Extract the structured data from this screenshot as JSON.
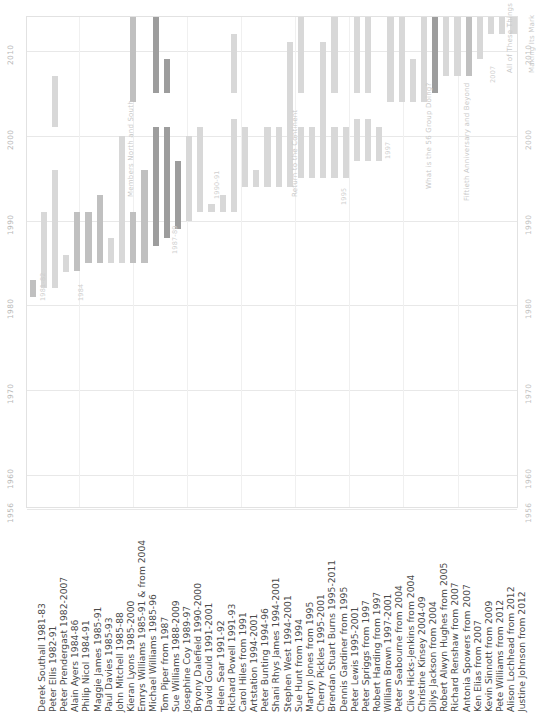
{
  "chart_data": {
    "type": "bar",
    "title": "",
    "subtitle": "",
    "xlabel": "",
    "ylabel": "",
    "ylim": [
      1956,
      2014
    ],
    "orientation": "vertical-timeline",
    "grid": true,
    "legend_position": "none",
    "y_ticks": [
      "2010",
      "2000",
      "1990",
      "1980",
      "1970",
      "1960",
      "1956"
    ],
    "y_tick_values": [
      2010,
      2000,
      1990,
      1980,
      1970,
      1960,
      1956
    ],
    "y_ticks_right": [
      "2010",
      "2000",
      "1990",
      "1980",
      "1970",
      "1960",
      "1956"
    ],
    "categories": [
      "Derek Southall  1981-83",
      "Peter Ellis  1982-91",
      "Peter Prendergast  1982-2007",
      "Alain Ayers  1984-86",
      "Philip Nicol  1984-91",
      "Maggie James  1985-91",
      "Paul Davies  1985-93",
      "John Mitchell  1985-88",
      "Kieran Lyons  1985-2000",
      "Emrys Williams  1985-91 & from 2004",
      "Michael Williams  1985-96",
      "Tom Piper  from 1987",
      "Sue Williams  1988-2009",
      "Josephine Coy  1989-97",
      "Bryony Dalefield  1990-2000",
      "David Gould  1991-2001",
      "Helen Sear  1991-92",
      "Richard Powell  1991-93",
      "Carol Hiles  from 1991",
      "Artstation  1994-2001",
      "Peter Bunting  1994-96",
      "Shani Rhys James  1994-2001",
      "Stephen West  1994-2001",
      "Sue Hunt  from 1994",
      "Martyn Jones  from 1995",
      "Cherry Pickles  1995-2001",
      "Brendan Stuart Burns  1995-2011",
      "Dennis Gardiner  from 1995",
      "Peter Lewis  1995-2001",
      "Peter Spriggs  from 1997",
      "Robert Harding  from 1997",
      "William Brown  1997-2001",
      "Peter Seabourne  from 2004",
      "Clive Hicks-Jenkins  from 2004",
      "Christine Kinsey  2004-09",
      "Dilys Jackson  from 2004",
      "Robert Alwyn Hughes  from 2005",
      "Richard Renshaw  from 2007",
      "Antonia Spowers  from 2007",
      "Ken Elias  from 2007",
      "Kevin Sinnott  from 2009",
      "Pete Williams  from 2012",
      "Alison Lochhead  from 2012",
      "Justine Johnson  from 2012"
    ],
    "bars": [
      {
        "label": "Derek Southall  1981-83",
        "start": 1981,
        "end": 1983,
        "tone": "mid"
      },
      {
        "label": "Peter Ellis  1982-91",
        "start": 1982,
        "end": 1991,
        "tone": "light"
      },
      {
        "label": "Peter Prendergast  1982-2007",
        "start": 1982,
        "end": 2007,
        "tone": "light",
        "gap_start": 1996,
        "gap_end": 2001
      },
      {
        "label": "Alain Ayers  1984-86",
        "start": 1984,
        "end": 1986,
        "tone": "light"
      },
      {
        "label": "Philip Nicol  1984-91",
        "start": 1984,
        "end": 1991,
        "tone": "mid"
      },
      {
        "label": "Maggie James  1985-91",
        "start": 1985,
        "end": 1991,
        "tone": "mid"
      },
      {
        "label": "Paul Davies  1985-93",
        "start": 1985,
        "end": 1993,
        "tone": "mid"
      },
      {
        "label": "John Mitchell  1985-88",
        "start": 1985,
        "end": 1988,
        "tone": "light"
      },
      {
        "label": "Kieran Lyons  1985-2000",
        "start": 1985,
        "end": 2000,
        "tone": "light"
      },
      {
        "label": "Emrys Williams  1985-91 & from 2004",
        "start": 1985,
        "end": 1991,
        "tone": "mid",
        "segment2_start": 2004,
        "segment2_end": 2014
      },
      {
        "label": "Michael Williams  1985-96",
        "start": 1985,
        "end": 1996,
        "tone": "mid"
      },
      {
        "label": "Tom Piper  from 1987",
        "start": 1987,
        "end": 2014,
        "tone": "dark",
        "gap_start": 2001,
        "gap_end": 2005
      },
      {
        "label": "Sue Williams  1988-2009",
        "start": 1988,
        "end": 2009,
        "tone": "dark",
        "gap_start": 2001,
        "gap_end": 2005
      },
      {
        "label": "Josephine Coy  1989-97",
        "start": 1989,
        "end": 1997,
        "tone": "dark"
      },
      {
        "label": "Bryony Dalefield  1990-2000",
        "start": 1990,
        "end": 2000,
        "tone": "light"
      },
      {
        "label": "David Gould  1991-2001",
        "start": 1991,
        "end": 2001,
        "tone": "light"
      },
      {
        "label": "Helen Sear  1991-92",
        "start": 1991,
        "end": 1992,
        "tone": "light"
      },
      {
        "label": "Richard Powell  1991-93",
        "start": 1991,
        "end": 1993,
        "tone": "light"
      },
      {
        "label": "Carol Hiles  from 1991",
        "start": 1991,
        "end": 2012,
        "tone": "light",
        "gap_start": 2002,
        "gap_end": 2005
      },
      {
        "label": "Artstation  1994-2001",
        "start": 1994,
        "end": 2001,
        "tone": "light"
      },
      {
        "label": "Peter Bunting  1994-96",
        "start": 1994,
        "end": 1996,
        "tone": "light"
      },
      {
        "label": "Shani Rhys James  1994-2001",
        "start": 1994,
        "end": 2001,
        "tone": "light"
      },
      {
        "label": "Stephen West  1994-2001",
        "start": 1994,
        "end": 2001,
        "tone": "light"
      },
      {
        "label": "Sue Hunt  from 1994",
        "start": 1994,
        "end": 2011,
        "tone": "light"
      },
      {
        "label": "Martyn Jones  from 1995",
        "start": 1995,
        "end": 2014,
        "tone": "light",
        "gap_start": 2001,
        "gap_end": 2005
      },
      {
        "label": "Cherry Pickles  1995-2001",
        "start": 1995,
        "end": 2001,
        "tone": "light"
      },
      {
        "label": "Brendan Stuart Burns  1995-2011",
        "start": 1995,
        "end": 2011,
        "tone": "light"
      },
      {
        "label": "Dennis Gardiner  from 1995",
        "start": 1995,
        "end": 2014,
        "tone": "light",
        "gap_start": 2001,
        "gap_end": 2005
      },
      {
        "label": "Peter Lewis  1995-2001",
        "start": 1995,
        "end": 2001,
        "tone": "light"
      },
      {
        "label": "Peter Spriggs  from 1997",
        "start": 1997,
        "end": 2014,
        "tone": "light",
        "gap_start": 2002,
        "gap_end": 2005
      },
      {
        "label": "Robert Harding  from 1997",
        "start": 1997,
        "end": 2014,
        "tone": "light",
        "gap_start": 2002,
        "gap_end": 2005
      },
      {
        "label": "William Brown  1997-2001",
        "start": 1997,
        "end": 2001,
        "tone": "light"
      },
      {
        "label": "Peter Seabourne  from 2004",
        "start": 2004,
        "end": 2014,
        "tone": "light"
      },
      {
        "label": "Clive Hicks-Jenkins  from 2004",
        "start": 2004,
        "end": 2014,
        "tone": "light"
      },
      {
        "label": "Christine Kinsey  2004-09",
        "start": 2004,
        "end": 2009,
        "tone": "light"
      },
      {
        "label": "Dilys Jackson  from 2004",
        "start": 2004,
        "end": 2014,
        "tone": "light"
      },
      {
        "label": "Robert Alwyn Hughes  from 2005",
        "start": 2005,
        "end": 2014,
        "tone": "dark"
      },
      {
        "label": "Richard Renshaw  from 2007",
        "start": 2007,
        "end": 2014,
        "tone": "light"
      },
      {
        "label": "Antonia Spowers  from 2007",
        "start": 2007,
        "end": 2014,
        "tone": "light"
      },
      {
        "label": "Ken Elias  from 2007",
        "start": 2007,
        "end": 2014,
        "tone": "mid"
      },
      {
        "label": "Kevin Sinnott  from 2009",
        "start": 2009,
        "end": 2014,
        "tone": "light"
      },
      {
        "label": "Pete Williams  from 2012",
        "start": 2012,
        "end": 2014,
        "tone": "light"
      },
      {
        "label": "Alison Lochhead  from 2012",
        "start": 2012,
        "end": 2014,
        "tone": "light"
      },
      {
        "label": "Justine Johnson  from 2012",
        "start": 2012,
        "end": 2014,
        "tone": "light"
      }
    ],
    "annotations": [
      {
        "text": "1981-82",
        "x": 38,
        "y": 300
      },
      {
        "text": "1984",
        "x": 76,
        "y": 300
      },
      {
        "text": "Members North and South",
        "x": 126,
        "y": 196
      },
      {
        "text": "1987-89",
        "x": 170,
        "y": 253
      },
      {
        "text": "1990-91",
        "x": 212,
        "y": 198
      },
      {
        "text": "Return to the Continent",
        "x": 290,
        "y": 196
      },
      {
        "text": "1995",
        "x": 339,
        "y": 204
      },
      {
        "text": "1997",
        "x": 383,
        "y": 158
      },
      {
        "text": "What is the 56 Group Doing?",
        "x": 424,
        "y": 188
      },
      {
        "text": "Fiftieth Anniversary and Beyond",
        "x": 462,
        "y": 200
      },
      {
        "text": "2007",
        "x": 488,
        "y": 82
      },
      {
        "text": "All of These Things",
        "x": 505,
        "y": 72
      },
      {
        "text": "Making Its Mark",
        "x": 527,
        "y": 72
      }
    ],
    "colors": {
      "light": "#d8d8d8",
      "mid": "#c0c0c0",
      "dark": "#9d9d9d",
      "gridline": "#e8e8e8",
      "frame": "#e2e2e2",
      "tick_text": "#b8b8b8",
      "label_text": "#4a4a4a",
      "annotation_text": "#cfcfcf",
      "background": "#ffffff"
    }
  }
}
